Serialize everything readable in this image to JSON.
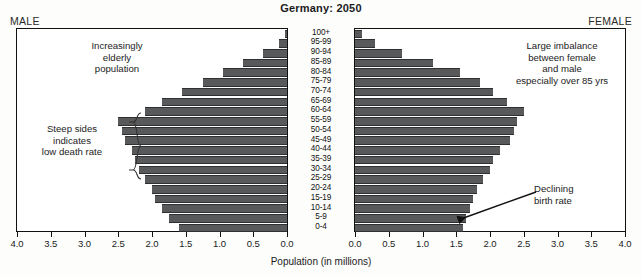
{
  "title": "Germany: 2050",
  "labels": {
    "male_side": "MALE",
    "female_side": "FEMALE",
    "x_axis_title": "Population (in millions)"
  },
  "annotations": {
    "elderly": "Increasingly\nelderly\npopulation",
    "steep": "Steep sides\nindicates\nlow death rate",
    "imbalance": "Large imbalance\nbetween female\nand male\nespecially over 85 yrs",
    "birth": "Declining\nbirth rate"
  },
  "colors": {
    "bar": "#58595b",
    "bar_edge": "#303030",
    "axis": "#111111",
    "panel_bg": "#ffffff",
    "page_bg": "#fdfdfb"
  },
  "chart_data": {
    "type": "bar",
    "title": "Germany: 2050",
    "subtype": "population-pyramid",
    "xlabel": "Population (in millions)",
    "ylabel": "",
    "xlim": [
      0,
      4
    ],
    "grid": false,
    "legend": "none",
    "tick_values": [
      4.0,
      3.5,
      3.0,
      2.5,
      2.0,
      1.5,
      1.0,
      0.5,
      0.0
    ],
    "tick_labels_male": [
      "4.0",
      "3.5",
      "3.0",
      "2.5",
      "2.0",
      "1.5",
      "1.0",
      "0.5",
      "0.0"
    ],
    "tick_labels_female": [
      "0.0",
      "0.5",
      "1.0",
      "1.5",
      "2.0",
      "2.5",
      "3.0",
      "3.5",
      "4.0"
    ],
    "categories": [
      "100+",
      "95-99",
      "90-94",
      "85-89",
      "80-84",
      "75-79",
      "70-74",
      "65-69",
      "60-64",
      "55-59",
      "50-54",
      "45-49",
      "40-44",
      "35-39",
      "30-34",
      "25-29",
      "20-24",
      "15-19",
      "10-14",
      "5-9",
      "0-4"
    ],
    "series": [
      {
        "name": "MALE",
        "direction": "left",
        "values": [
          0.03,
          0.12,
          0.35,
          0.65,
          0.95,
          1.25,
          1.55,
          1.85,
          2.1,
          2.5,
          2.45,
          2.4,
          2.3,
          2.25,
          2.2,
          2.1,
          2.0,
          1.95,
          1.85,
          1.75,
          1.6
        ]
      },
      {
        "name": "FEMALE",
        "direction": "right",
        "values": [
          0.1,
          0.3,
          0.7,
          1.15,
          1.55,
          1.85,
          2.05,
          2.25,
          2.5,
          2.4,
          2.35,
          2.3,
          2.15,
          2.05,
          2.0,
          1.9,
          1.8,
          1.75,
          1.7,
          1.65,
          1.6
        ]
      }
    ]
  }
}
